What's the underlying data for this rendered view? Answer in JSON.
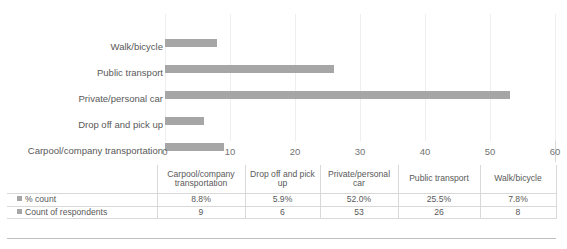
{
  "chart_data": {
    "type": "bar",
    "orientation": "horizontal",
    "title": "",
    "xlabel": "",
    "ylabel": "",
    "xlim": [
      0,
      60
    ],
    "xticks": [
      "0",
      "10",
      "20",
      "30",
      "40",
      "50",
      "60"
    ],
    "grid": true,
    "legend_position": "table-left",
    "categories": [
      "Carpool/company transportation",
      "Drop off and pick up",
      "Private/personal car",
      "Public transport",
      "Walk/bicycle"
    ],
    "display_order_top_to_bottom": [
      "Walk/bicycle",
      "Public transport",
      "Private/personal car",
      "Drop off and pick up",
      "Carpool/company transportation"
    ],
    "series": [
      {
        "name": "% count",
        "values": [
          "8.8%",
          "5.9%",
          "52.0%",
          "25.5%",
          "7.8%"
        ]
      },
      {
        "name": "Count of respondents",
        "values": [
          9,
          6,
          53,
          26,
          8
        ],
        "plotted": true
      }
    ],
    "bar_color": "#a6a6a6",
    "bars": [
      {
        "category": "Walk/bicycle",
        "value": 8
      },
      {
        "category": "Public transport",
        "value": 26
      },
      {
        "category": "Private/personal car",
        "value": 53
      },
      {
        "category": "Drop off and pick up",
        "value": 6
      },
      {
        "category": "Carpool/company transportation",
        "value": 9
      }
    ]
  },
  "table": {
    "corner_label": "",
    "column_headers": [
      "Carpool/company transportation",
      "Drop off and pick up",
      "Private/personal car",
      "Public transport",
      "Walk/bicycle"
    ],
    "rows": [
      {
        "label": "% count",
        "values": [
          "8.8%",
          "5.9%",
          "52.0%",
          "25.5%",
          "7.8%"
        ]
      },
      {
        "label": "Count of respondents",
        "values": [
          "9",
          "6",
          "53",
          "26",
          "8"
        ]
      }
    ]
  }
}
